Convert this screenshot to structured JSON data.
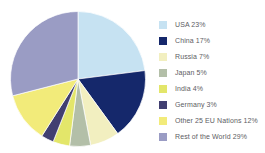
{
  "chart_data": {
    "type": "pie",
    "title": "",
    "subtitle": "",
    "xlabel": "",
    "ylabel": "",
    "grid": false,
    "legend_position": "right",
    "start_angle_deg": 0,
    "direction": "clockwise",
    "units": "percent",
    "total": 100,
    "categories": [
      "USA",
      "China",
      "Russia",
      "Japan",
      "India",
      "Germany",
      "Other 25 EU Nations",
      "Rest of the World"
    ],
    "values": [
      23,
      17,
      7,
      5,
      4,
      3,
      12,
      29
    ],
    "colors": [
      "#c6e2f2",
      "#15286b",
      "#f2efc0",
      "#b3bfa8",
      "#e3e66a",
      "#413f71",
      "#f2eb7a",
      "#9a9cc4"
    ],
    "slices": [
      {
        "label": "USA",
        "value": 23,
        "display": "USA 23%",
        "color": "#c6e2f2"
      },
      {
        "label": "China",
        "value": 17,
        "display": "China 17%",
        "color": "#15286b"
      },
      {
        "label": "Russia",
        "value": 7,
        "display": "Russia 7%",
        "color": "#f2efc0"
      },
      {
        "label": "Japan",
        "value": 5,
        "display": "Japan 5%",
        "color": "#b3bfa8"
      },
      {
        "label": "India",
        "value": 4,
        "display": "India 4%",
        "color": "#e3e66a"
      },
      {
        "label": "Germany",
        "value": 3,
        "display": "Germany 3%",
        "color": "#413f71"
      },
      {
        "label": "Other 25 EU Nations",
        "value": 12,
        "display": "Other 25 EU Nations 12%",
        "color": "#f2eb7a"
      },
      {
        "label": "Rest of the World",
        "value": 29,
        "display": "Rest of the World 29%",
        "color": "#9a9cc4"
      }
    ]
  },
  "legend": {
    "items": [
      {
        "display": "USA 23%",
        "color": "#c6e2f2",
        "swatch_name": "legend-swatch-usa"
      },
      {
        "display": "China 17%",
        "color": "#15286b",
        "swatch_name": "legend-swatch-china"
      },
      {
        "display": "Russia 7%",
        "color": "#f2efc0",
        "swatch_name": "legend-swatch-russia"
      },
      {
        "display": "Japan 5%",
        "color": "#b3bfa8",
        "swatch_name": "legend-swatch-japan"
      },
      {
        "display": "India 4%",
        "color": "#e3e66a",
        "swatch_name": "legend-swatch-india"
      },
      {
        "display": "Germany 3%",
        "color": "#413f71",
        "swatch_name": "legend-swatch-germany"
      },
      {
        "display": "Other 25 EU Nations 12%",
        "color": "#f2eb7a",
        "swatch_name": "legend-swatch-other-eu"
      },
      {
        "display": "Rest of the World 29%",
        "color": "#9a9cc4",
        "swatch_name": "legend-swatch-rest-of-world"
      }
    ]
  },
  "style": {
    "background": "#ffffff",
    "legend_text_color": "#5d5d63"
  }
}
